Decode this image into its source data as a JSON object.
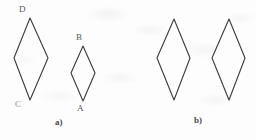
{
  "figure": {
    "background_color": "#fdfdfd",
    "stroke_color": "#3a3a3d",
    "label_color": "#555558",
    "part_label_color": "#4a4a4d",
    "width": 256,
    "height": 140,
    "parts": [
      {
        "id": "a",
        "label": "a)",
        "label_x": 55,
        "label_y": 118,
        "shapes": [
          {
            "name": "large-rhombus-DC",
            "points": "30,18 48,58 30,100 14,58",
            "top_x": 30,
            "top_y": 18,
            "right_x": 48,
            "right_y": 58,
            "bottom_x": 30,
            "bottom_y": 100,
            "left_x": 14,
            "left_y": 58
          },
          {
            "name": "small-rhombus-BA",
            "points": "83,46 95,73 83,101 71,73",
            "top_x": 83,
            "top_y": 46,
            "right_x": 95,
            "right_y": 73,
            "bottom_x": 83,
            "bottom_y": 101,
            "left_x": 71,
            "left_y": 73
          }
        ],
        "vertex_labels": [
          {
            "name": "vertex-label-D",
            "text": "D",
            "x": 19,
            "y": 5
          },
          {
            "name": "vertex-label-C",
            "text": "C",
            "x": 15,
            "y": 100
          },
          {
            "name": "vertex-label-B",
            "text": "B",
            "x": 76,
            "y": 33
          },
          {
            "name": "vertex-label-A",
            "text": "A",
            "x": 77,
            "y": 104
          }
        ]
      },
      {
        "id": "b",
        "label": "b)",
        "label_x": 194,
        "label_y": 116,
        "shapes": [
          {
            "name": "rhombus-b-left",
            "points": "174,19 190,58 174,100 157,58",
            "top_x": 174,
            "top_y": 19,
            "right_x": 190,
            "right_y": 58,
            "bottom_x": 174,
            "bottom_y": 100,
            "left_x": 157,
            "left_y": 58
          },
          {
            "name": "rhombus-b-right",
            "points": "229,19 245,58 229,100 212,58",
            "top_x": 229,
            "top_y": 19,
            "right_x": 245,
            "right_y": 58,
            "bottom_x": 229,
            "bottom_y": 100,
            "left_x": 212,
            "left_y": 58
          }
        ],
        "vertex_labels": []
      }
    ]
  }
}
